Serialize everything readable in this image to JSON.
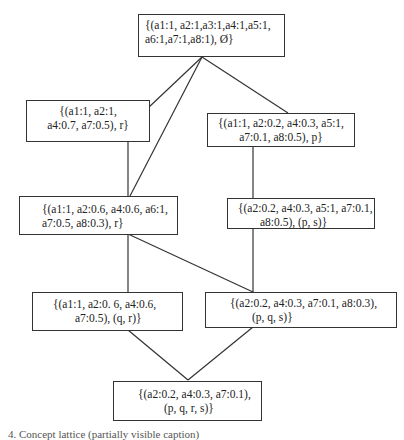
{
  "diagram": {
    "type": "concept-lattice",
    "nodes": [
      {
        "id": "top",
        "lines": [
          "{(a1:1, a2:1,a3:1,a4:1,a5:1,",
          "a6:1,a7:1,a8:1), Ø}"
        ]
      },
      {
        "id": "r",
        "lines": [
          "{(a1:1, a2:1,",
          "a4:0.7, a7:0.5), r}"
        ]
      },
      {
        "id": "p",
        "lines": [
          "{(a1:1, a2:0.2, a4:0.3, a5:1,",
          "a7:0.1, a8:0.5), p}"
        ]
      },
      {
        "id": "r2",
        "lines": [
          "{(a1:1, a2:0.6, a4:0.6, a6:1,",
          "a7:0.5, a8:0.3), r}"
        ]
      },
      {
        "id": "ps",
        "lines": [
          "{(a2:0.2,  a4:0.3,  a5:1,  a7:0.1,",
          "a8:0.5), (p, s)}"
        ]
      },
      {
        "id": "qr",
        "lines": [
          "{(a1:1,    a2:0.    6,    a4:0.6,",
          "a7:0.5), (q, r)}"
        ]
      },
      {
        "id": "pqs",
        "lines": [
          "{(a2:0.2,  a4:0.3,  a7:0.1,  a8:0.3),",
          "(p, q, s)}"
        ]
      },
      {
        "id": "bottom",
        "lines": [
          "{(a2:0.2,  a4:0.3,  a7:0.1),",
          "(p, q, r, s)}"
        ]
      }
    ],
    "edges": [
      [
        "top",
        "r"
      ],
      [
        "top",
        "p"
      ],
      [
        "top",
        "r2"
      ],
      [
        "r",
        "r2"
      ],
      [
        "p",
        "ps"
      ],
      [
        "r2",
        "qr"
      ],
      [
        "r2",
        "pqs"
      ],
      [
        "ps",
        "pqs"
      ],
      [
        "qr",
        "bottom"
      ],
      [
        "pqs",
        "bottom"
      ]
    ],
    "caption": "4. Concept lattice (partially visible caption)"
  }
}
